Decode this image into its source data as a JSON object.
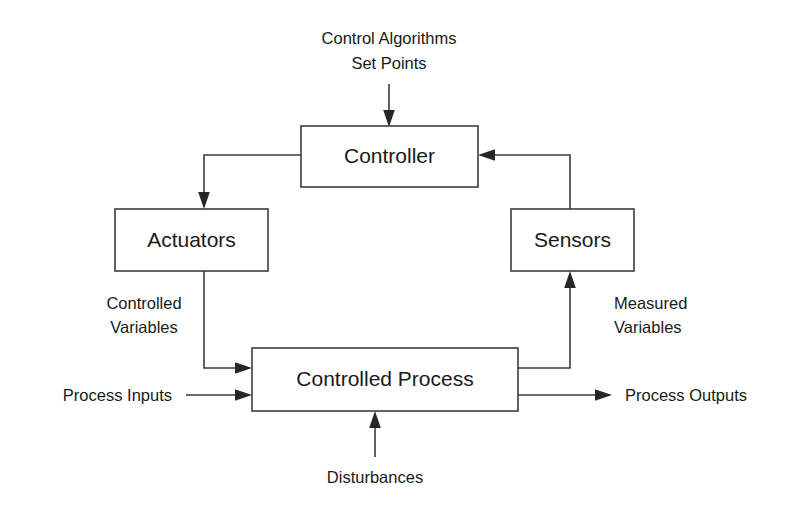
{
  "diagram": {
    "colors": {
      "background": "#ffffff",
      "stroke": "#3c3c3c",
      "arrow_fill": "#262626",
      "text": "#1a1a1a"
    },
    "blocks": [
      {
        "id": "controller",
        "label": "Controller"
      },
      {
        "id": "actuators",
        "label": "Actuators"
      },
      {
        "id": "sensors",
        "label": "Sensors"
      },
      {
        "id": "controlled_process",
        "label": "Controlled Process"
      }
    ],
    "labels": {
      "control_algorithms_line1": "Control Algorithms",
      "control_algorithms_line2": "Set Points",
      "controlled_variables_line1": "Controlled",
      "controlled_variables_line2": "Variables",
      "measured_variables_line1": "Measured",
      "measured_variables_line2": "Variables",
      "process_inputs": "Process Inputs",
      "process_outputs": "Process Outputs",
      "disturbances": "Disturbances"
    },
    "icons": {
      "arrow_down": "arrow-down-icon",
      "arrow_up": "arrow-up-icon",
      "arrow_right": "arrow-right-icon",
      "arrow_left": "arrow-left-icon"
    }
  }
}
